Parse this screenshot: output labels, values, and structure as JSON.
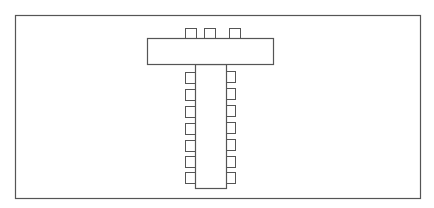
{
  "diagram": {
    "type": "seating-layout",
    "shape": "T-shaped table arrangement",
    "colors": {
      "background": "#ffffff",
      "stroke": "#555555",
      "fill": "#ffffff"
    },
    "frame": {
      "x": 15,
      "y": 15,
      "width": 405,
      "height": 183
    },
    "head_table": {
      "x": 147,
      "y": 38,
      "width": 126,
      "height": 26,
      "chairs": [
        {
          "x": 185,
          "y": 28,
          "width": 11,
          "height": 10
        },
        {
          "x": 204,
          "y": 28,
          "width": 11,
          "height": 10
        },
        {
          "x": 229,
          "y": 28,
          "width": 11,
          "height": 10
        }
      ]
    },
    "stem_table": {
      "x": 195,
      "y": 64,
      "width": 31,
      "height": 124,
      "left_chairs": [
        {
          "x": 185,
          "y": 72,
          "width": 10,
          "height": 11
        },
        {
          "x": 185,
          "y": 89,
          "width": 10,
          "height": 11
        },
        {
          "x": 185,
          "y": 106,
          "width": 10,
          "height": 11
        },
        {
          "x": 185,
          "y": 123,
          "width": 10,
          "height": 11
        },
        {
          "x": 185,
          "y": 140,
          "width": 10,
          "height": 11
        },
        {
          "x": 185,
          "y": 156,
          "width": 10,
          "height": 11
        },
        {
          "x": 185,
          "y": 172,
          "width": 10,
          "height": 11
        }
      ],
      "right_chairs": [
        {
          "x": 226,
          "y": 71,
          "width": 9,
          "height": 11
        },
        {
          "x": 226,
          "y": 88,
          "width": 9,
          "height": 11
        },
        {
          "x": 226,
          "y": 105,
          "width": 9,
          "height": 11
        },
        {
          "x": 226,
          "y": 122,
          "width": 9,
          "height": 11
        },
        {
          "x": 226,
          "y": 139,
          "width": 9,
          "height": 11
        },
        {
          "x": 226,
          "y": 156,
          "width": 9,
          "height": 11
        },
        {
          "x": 226,
          "y": 172,
          "width": 9,
          "height": 11
        }
      ]
    },
    "counts": {
      "tables": 2,
      "head_table_chairs": 3,
      "stem_left_chairs": 7,
      "stem_right_chairs": 7,
      "total_chairs": 17
    }
  }
}
